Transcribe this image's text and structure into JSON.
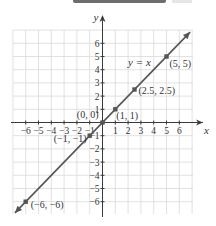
{
  "chart_data": {
    "type": "line",
    "title": "",
    "xlabel": "x",
    "ylabel": "y",
    "xlim": [
      -7,
      7
    ],
    "ylim": [
      -7,
      7
    ],
    "grid": true,
    "x_ticks": [
      -6,
      -5,
      -4,
      -3,
      -2,
      -1,
      1,
      2,
      3,
      4,
      5,
      6
    ],
    "y_ticks": [
      -6,
      -5,
      -4,
      -3,
      -2,
      -1,
      1,
      2,
      3,
      4,
      5,
      6
    ],
    "x_tick_labels": [
      "−6",
      "−5",
      "−4",
      "−3",
      "−2",
      "−1",
      "1",
      "2",
      "3",
      "4",
      "5",
      "6"
    ],
    "y_tick_labels": [
      "−6",
      "−5",
      "−4",
      "−3",
      "−2",
      "−1",
      "1",
      "2",
      "3",
      "4",
      "5",
      "6"
    ],
    "series": [
      {
        "name": "y = x",
        "equation_label": "y = x",
        "color": "#555555",
        "line": {
          "x": [
            -7,
            7
          ],
          "y": [
            -7,
            7
          ]
        },
        "arrows": "both"
      }
    ],
    "points": [
      {
        "x": -6,
        "y": -6,
        "label": "(−6, −6)"
      },
      {
        "x": -1,
        "y": -1,
        "label": "(−1, −1)"
      },
      {
        "x": 0,
        "y": 0,
        "label": "(0, 0)"
      },
      {
        "x": 1,
        "y": 1,
        "label": "(1, 1)"
      },
      {
        "x": 2.5,
        "y": 2.5,
        "label": "(2.5, 2.5)"
      },
      {
        "x": 5,
        "y": 5,
        "label": "(5, 5)"
      }
    ],
    "colors": {
      "line": "#555555",
      "axis": "#3a3a3a",
      "grid": "#d9d9d9",
      "point": "#555555"
    }
  }
}
